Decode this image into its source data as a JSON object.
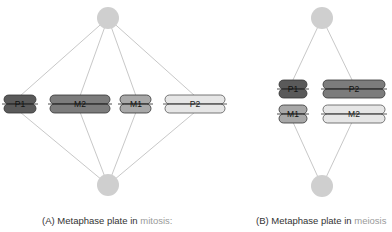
{
  "colors": {
    "pole": "#cfcfcf",
    "spindle": "#c8c8c8",
    "outline": "#444444",
    "P1": "#5a5a5a",
    "M2": "#7c7c7c",
    "M1": "#a8a8a8",
    "P2": "#e6e6e6",
    "highlight_text": "#9a9a9a"
  },
  "panel_a": {
    "caption_prefix": "(A) Metaphase plate in ",
    "caption_highlight": "mitosis:",
    "chromosomes": [
      {
        "label": "P1"
      },
      {
        "label": "M2"
      },
      {
        "label": "M1"
      },
      {
        "label": "P2"
      }
    ]
  },
  "panel_b": {
    "caption_prefix": "(B) Metaphase plate in ",
    "caption_highlight": "meiosis",
    "chromosomes": [
      {
        "label": "P1"
      },
      {
        "label": "P2"
      },
      {
        "label": "M1"
      },
      {
        "label": "M2"
      }
    ]
  }
}
